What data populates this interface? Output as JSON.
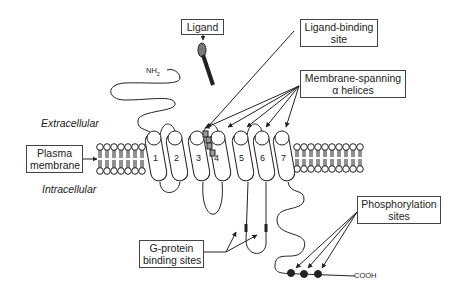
{
  "labels": {
    "ligand": "Ligand",
    "ligand_binding_site": [
      "Ligand-binding",
      "site"
    ],
    "membrane_spanning": [
      "Membrane-spanning",
      "α helices"
    ],
    "plasma_membrane": [
      "Plasma",
      "membrane"
    ],
    "g_protein": [
      "G-protein",
      "binding sites"
    ],
    "phosphorylation": [
      "Phosphorylation",
      "sites"
    ]
  },
  "regions": {
    "extracellular": "Extracellular",
    "intracellular": "Intracellular"
  },
  "termini": {
    "n_terminus": "NH",
    "n_sub": "2",
    "c_terminus": "COOH"
  },
  "helices": [
    "1",
    "2",
    "3",
    "4",
    "5",
    "6",
    "7"
  ]
}
